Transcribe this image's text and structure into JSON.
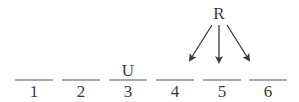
{
  "diagram": {
    "slots": [
      {
        "number": "1",
        "above": ""
      },
      {
        "number": "2",
        "above": ""
      },
      {
        "number": "3",
        "above": "U"
      },
      {
        "number": "4",
        "above": ""
      },
      {
        "number": "5",
        "above": ""
      },
      {
        "number": "6",
        "above": ""
      }
    ],
    "source_label": "R",
    "arrow_targets": [
      "4",
      "5",
      "6"
    ],
    "colors": {
      "line": "#555555",
      "text": "#3a3a3a"
    }
  }
}
